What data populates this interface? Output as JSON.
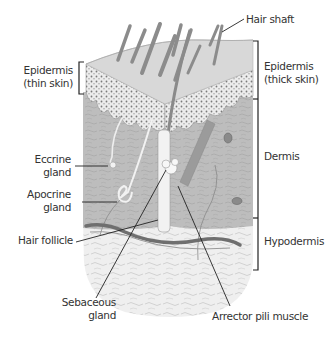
{
  "diagram": {
    "colors": {
      "background": "#ffffff",
      "epidermis": "#d4d4d4",
      "epidermis_top": "#e6e6e6",
      "dermis": "#b9b9b9",
      "hypodermis": "#e9e9e9",
      "hair": "#8f8f8f",
      "vessel": "#6a6a6a",
      "leader": "#222222",
      "text": "#333333"
    },
    "labels": {
      "hair_shaft": "Hair shaft",
      "epidermis_thin": [
        "Epidermis",
        "(thin skin)"
      ],
      "epidermis_thick": [
        "Epidermis",
        "(thick skin)"
      ],
      "dermis": "Dermis",
      "hypodermis": "Hypodermis",
      "eccrine_gland": [
        "Eccrine",
        "gland"
      ],
      "apocrine_gland": [
        "Apocrine",
        "gland"
      ],
      "hair_follicle": "Hair follicle",
      "sebaceous_gland": [
        "Sebaceous",
        "gland"
      ],
      "arrector_pili": "Arrector pili muscle"
    }
  }
}
